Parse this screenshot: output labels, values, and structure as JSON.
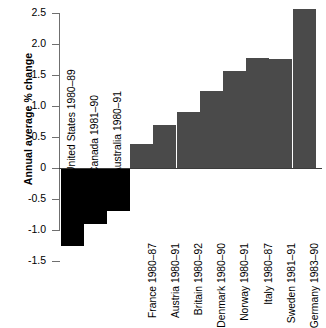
{
  "chart_data": {
    "type": "bar",
    "title": "",
    "subtitle": "",
    "xlabel": "",
    "ylabel": "Annual average % change",
    "ylim": [
      -1.5,
      2.5
    ],
    "ytick_labels": [
      "2.5",
      "2.0",
      "1.5",
      "1.0",
      "0.5",
      "0",
      "-0.5",
      "-1.0",
      "-1.5"
    ],
    "ytick_values": [
      2.5,
      2.0,
      1.5,
      1.0,
      0.5,
      0,
      -0.5,
      -1.0,
      -1.5
    ],
    "grid": false,
    "legend": "none",
    "categories": [
      "United States 1980–89",
      "Canada 1981–90",
      "Australia 1980–91",
      "France 1980–87",
      "Austria 1980–91",
      "Britain 1980–92",
      "Denmark 1980–90",
      "Norway 1980–91",
      "Italy 1980–87",
      "Sweden 1981–91",
      "Germany 1983–90"
    ],
    "values": [
      -1.25,
      -0.9,
      -0.7,
      0.38,
      0.69,
      0.9,
      1.25,
      1.57,
      1.77,
      1.76,
      2.56
    ],
    "colors": {
      "negative_bar": "#000000",
      "positive_bar": "#4a4a4a",
      "axis": "#6f6f6f",
      "zero_line": "#3c3c3c",
      "background": "#ffffff",
      "text": "#000000"
    }
  }
}
